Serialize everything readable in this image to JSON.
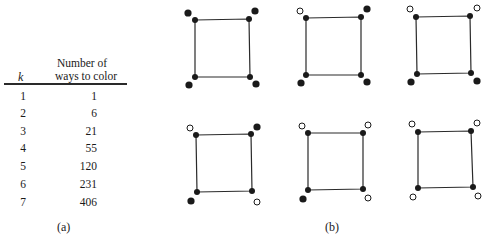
{
  "table": {
    "header_k": "k",
    "header_line1": "Number of",
    "header_line2": "ways to color",
    "rows": [
      {
        "k": "1",
        "value": "1"
      },
      {
        "k": "2",
        "value": "6"
      },
      {
        "k": "3",
        "value": "21"
      },
      {
        "k": "4",
        "value": "55"
      },
      {
        "k": "5",
        "value": "120"
      },
      {
        "k": "6",
        "value": "231"
      },
      {
        "k": "7",
        "value": "406"
      }
    ],
    "caption": "(a)"
  },
  "figure": {
    "caption": "(b)",
    "squares": [
      {
        "corners": [
          "filled",
          "filled",
          "filled",
          "filled"
        ]
      },
      {
        "corners": [
          "open",
          "filled",
          "filled",
          "filled"
        ]
      },
      {
        "corners": [
          "open",
          "open",
          "filled",
          "filled"
        ]
      },
      {
        "corners": [
          "open",
          "filled",
          "filled",
          "open"
        ]
      },
      {
        "corners": [
          "open",
          "open",
          "filled",
          "open"
        ]
      },
      {
        "corners": [
          "open",
          "open",
          "open",
          "open"
        ]
      }
    ],
    "corner_order": [
      "top-left",
      "top-right",
      "bottom-left",
      "bottom-right"
    ]
  }
}
